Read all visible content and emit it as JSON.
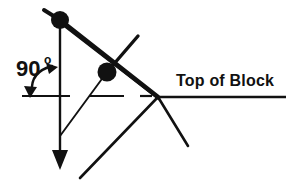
{
  "figure": {
    "title": "",
    "background_color": "#ffffff",
    "stroke_color": "#111111",
    "labels": {
      "angle_value": "90",
      "angle_degree_symbol": "o",
      "angle_full": "90o",
      "surface_label": "Top of Block"
    },
    "elements": {
      "pivot_node_label": "upper pivot point",
      "mid_node_label": "middle pivot point",
      "vertical_axis_label": "vertical reference line with downward arrow",
      "angle_arc_label": "double-headed arc indicating 90 degrees",
      "surface_line_label": "horizontal top of block line",
      "linkage_label": "linkage arms"
    },
    "geometry": {
      "node_top": {
        "x": 60,
        "y": 20,
        "r": 9
      },
      "node_mid": {
        "x": 107,
        "y": 72,
        "r": 9
      },
      "vertex_right": {
        "x": 158,
        "y": 97
      },
      "vertical_line": {
        "x": 60,
        "y1": 20,
        "y2": 158
      },
      "arrow_tip": {
        "x": 60,
        "y": 168
      },
      "surface_line": {
        "x1": 158,
        "y1": 97,
        "x2": 286,
        "y2": 97
      },
      "dash_left": {
        "x1": 22,
        "y1": 96,
        "x2": 70,
        "y2": 96
      },
      "dash_mid": {
        "x1": 89,
        "y1": 96,
        "x2": 124,
        "y2": 96
      },
      "dash_tick": {
        "x1": 140,
        "y1": 96,
        "x2": 152,
        "y2": 96
      },
      "arc_start": {
        "x": 31,
        "y": 94
      },
      "arc_end": {
        "x": 56,
        "y": 68
      },
      "stub_top_left": {
        "x": 44,
        "y": 10
      },
      "arm_up_right": {
        "x": 138,
        "y": 36
      },
      "arm_down_left_thin": {
        "x": 60,
        "y": 136
      },
      "diag_lower_left": {
        "x": 80,
        "y": 178
      },
      "diag_lower_right": {
        "x": 188,
        "y": 146
      },
      "angle_text_pos": {
        "x": 16,
        "y": 76
      },
      "surface_text_pos": {
        "x": 176,
        "y": 86
      }
    }
  }
}
